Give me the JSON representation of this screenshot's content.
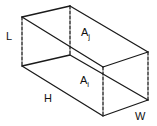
{
  "diagram": {
    "labels": {
      "length": "L",
      "height": "H",
      "width": "W",
      "area_j": {
        "base": "A",
        "sub": "j"
      },
      "area_i": {
        "base": "A",
        "sub": "i"
      }
    },
    "colors": {
      "stroke": "#1a1a1a",
      "background": "#ffffff"
    }
  }
}
